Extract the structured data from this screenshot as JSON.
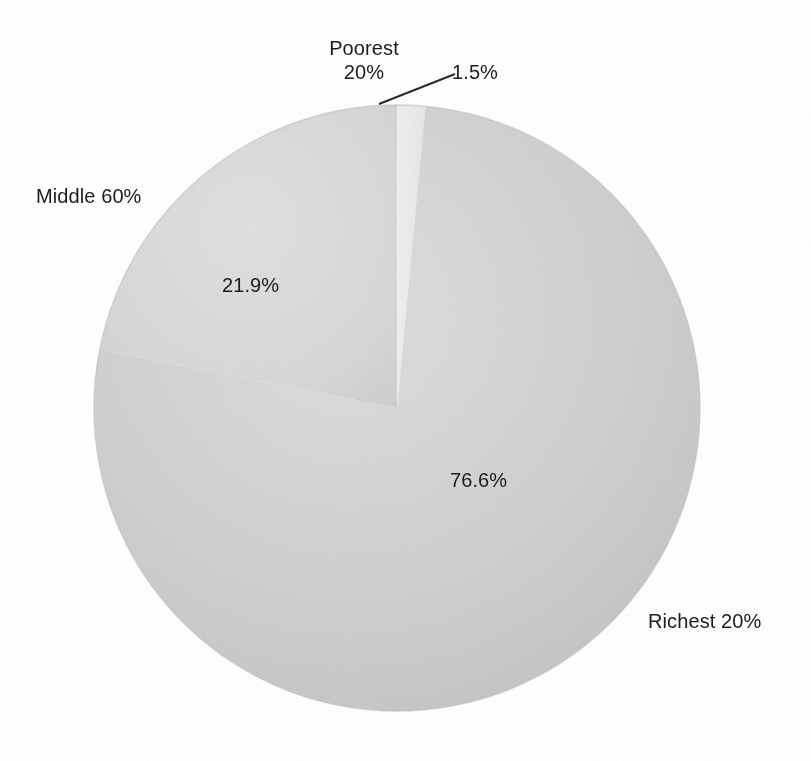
{
  "figure": {
    "background_color": "#ffffff",
    "width": 811,
    "height": 761
  },
  "chart_data": {
    "type": "pie",
    "title": "",
    "subtitle": "",
    "xlabel": "",
    "ylabel": "",
    "legend_position": "none",
    "grid": false,
    "start_angle_deg": 90,
    "direction": "clockwise",
    "categories": [
      "Poorest 20%",
      "Richest 20%",
      "Middle 60%"
    ],
    "values": [
      1.5,
      76.6,
      21.9
    ],
    "value_labels": [
      "1.5%",
      "76.6%",
      "21.9%"
    ],
    "colors": [
      "#ebebeb",
      "#c9c9c9",
      "#d7d7d7"
    ],
    "slices": [
      {
        "name": "Poorest 20%",
        "value": 1.5,
        "value_label": "1.5%",
        "color": "#ebebeb",
        "category_label": "Poorest\n20%",
        "label_placement": "outside-top",
        "has_leader_line": true
      },
      {
        "name": "Richest 20%",
        "value": 76.6,
        "value_label": "76.6%",
        "color": "#c9c9c9",
        "category_label": "Richest 20%",
        "label_placement": "outside-bottom-right",
        "has_leader_line": false
      },
      {
        "name": "Middle 60%",
        "value": 21.9,
        "value_label": "21.9%",
        "color": "#d7d7d7",
        "category_label": "Middle 60%",
        "label_placement": "outside-left",
        "has_leader_line": false
      }
    ]
  },
  "labels": {
    "poorest_name": "Poorest",
    "poorest_share": "20%",
    "poorest_value": "1.5%",
    "middle_name": "Middle 60%",
    "middle_value": "21.9%",
    "richest_name": "Richest 20%",
    "richest_value": "76.6%"
  }
}
